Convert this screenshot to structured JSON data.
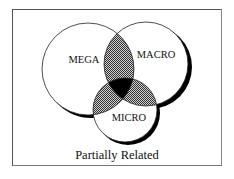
{
  "diagram": {
    "type": "venn",
    "caption": "Partially Related",
    "sets": [
      {
        "id": "mega",
        "label": "MEGA"
      },
      {
        "id": "macro",
        "label": "MACRO"
      },
      {
        "id": "micro",
        "label": "MICRO"
      }
    ],
    "regions": {
      "pairwise_overlaps": "dotted-gray",
      "triple_overlap": "black"
    },
    "colors": {
      "stroke": "#222222",
      "overlap_fill": "#8a8a8a",
      "center_fill": "#000000",
      "background": "#ffffff"
    }
  }
}
